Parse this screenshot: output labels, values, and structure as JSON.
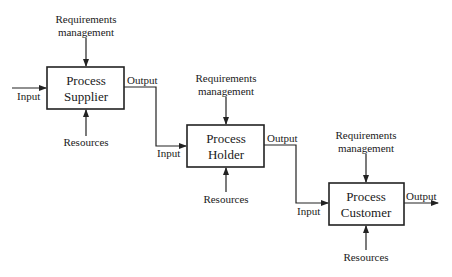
{
  "diagram": {
    "processes": [
      {
        "id": "supplier",
        "title_line1": "Process",
        "title_line2": "Supplier",
        "requirements_line1": "Requirements",
        "requirements_line2": "management",
        "resources": "Resources",
        "input": "Input",
        "output": "Output"
      },
      {
        "id": "holder",
        "title_line1": "Process",
        "title_line2": "Holder",
        "requirements_line1": "Requirements",
        "requirements_line2": "management",
        "resources": "Resources",
        "input": "Input",
        "output": "Output"
      },
      {
        "id": "customer",
        "title_line1": "Process",
        "title_line2": "Customer",
        "requirements_line1": "Requirements",
        "requirements_line2": "management",
        "resources": "Resources",
        "input": "Input",
        "output": "Output"
      }
    ]
  }
}
